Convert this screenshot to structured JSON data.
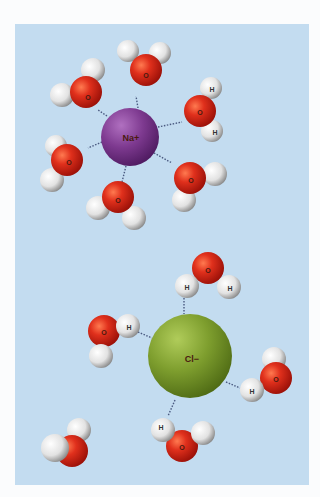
{
  "diagram": {
    "background_color": "#c3dcf0",
    "ions": [
      {
        "label": "Na+",
        "color": "#7a3a8c",
        "role": "cation"
      },
      {
        "label": "Cl−",
        "color": "#7a9a2c",
        "role": "anion"
      }
    ],
    "atom_labels": {
      "oxygen": "O",
      "hydrogen": "H"
    },
    "colors": {
      "oxygen": "#d0281a",
      "hydrogen": "#e8e8e8",
      "bond": "#4a5a80"
    }
  }
}
